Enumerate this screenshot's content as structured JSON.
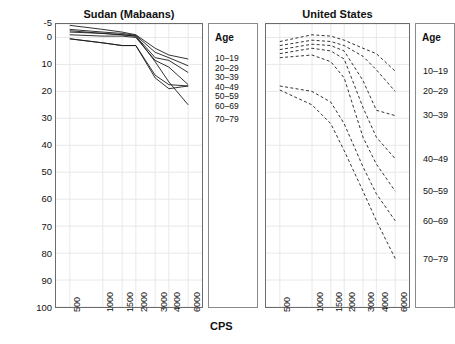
{
  "chart_data": {
    "type": "line",
    "title": "",
    "xlabel": "CPS",
    "ylabel": "Hearing loss (decibels)",
    "x": [
      500,
      1000,
      1500,
      2000,
      3000,
      4000,
      6000
    ],
    "xtick_labels": [
      "500",
      "1000",
      "1500",
      "2000",
      "3000",
      "4000",
      "6000"
    ],
    "xscale": "log",
    "ytick_labels": [
      "-5",
      "0",
      "10",
      "20",
      "30",
      "40",
      "50",
      "60",
      "70",
      "80",
      "90",
      "100"
    ],
    "ytick_values": [
      -5,
      0,
      10,
      20,
      30,
      40,
      50,
      60,
      70,
      80,
      90,
      100
    ],
    "ylim": [
      -5,
      100
    ],
    "y_inverted": true,
    "grid": true,
    "legend_title": "Age",
    "legend_entries": [
      "10–19",
      "20–29",
      "30–39",
      "40–49",
      "50–59",
      "60–69",
      "70–79"
    ],
    "panels": [
      {
        "name": "sudan",
        "title": "Sudan (Mabaans)",
        "linestyle": "solid",
        "series": [
          {
            "name": "10–19",
            "values": [
              -4.5,
              -3.0,
              -2.0,
              -1.0,
              4.0,
              6.5,
              8.0
            ]
          },
          {
            "name": "20–29",
            "values": [
              -3.0,
              -2.0,
              -1.5,
              -0.8,
              5.5,
              7.5,
              10.5
            ]
          },
          {
            "name": "30–39",
            "values": [
              -2.0,
              -1.5,
              -1.0,
              -0.5,
              7.5,
              8.5,
              13.0
            ]
          },
          {
            "name": "40–49",
            "values": [
              -1.0,
              -0.5,
              -0.5,
              0.0,
              8.5,
              11.0,
              17.5
            ]
          },
          {
            "name": "50–59",
            "values": [
              0.5,
              2.0,
              3.0,
              3.0,
              14.0,
              17.5,
              18.0
            ]
          },
          {
            "name": "60–69",
            "values": [
              0.5,
              2.0,
              3.0,
              3.0,
              15.0,
              19.0,
              18.0
            ]
          },
          {
            "name": "70–79",
            "values": [
              -2.5,
              -1.5,
              -1.0,
              -0.5,
              9.0,
              16.5,
              25.0
            ]
          }
        ]
      },
      {
        "name": "united_states",
        "title": "United States",
        "linestyle": "dashed",
        "series": [
          {
            "name": "10–19",
            "values": [
              1.5,
              -1.0,
              -0.5,
              1.0,
              4.0,
              6.0,
              12.5
            ]
          },
          {
            "name": "20–29",
            "values": [
              3.0,
              1.0,
              1.5,
              3.0,
              7.0,
              12.0,
              20.0
            ]
          },
          {
            "name": "30–39",
            "values": [
              4.5,
              2.5,
              3.0,
              5.0,
              16.0,
              27.0,
              29.0
            ]
          },
          {
            "name": "40–49",
            "values": [
              6.0,
              4.0,
              5.0,
              8.0,
              26.0,
              37.0,
              45.0
            ]
          },
          {
            "name": "50–59",
            "values": [
              7.5,
              6.5,
              9.0,
              15.0,
              37.0,
              47.0,
              57.0
            ]
          },
          {
            "name": "60–69",
            "values": [
              18.0,
              20.0,
              24.0,
              32.0,
              48.0,
              58.0,
              68.0
            ]
          },
          {
            "name": "70–79",
            "values": [
              19.5,
              25.0,
              32.0,
              42.0,
              57.0,
              68.0,
              82.0
            ]
          }
        ]
      }
    ]
  },
  "sudan_legend": {
    "title": "Age",
    "items": [
      "10–19",
      "20–29",
      "30–39",
      "40–49",
      "50–59",
      "60–69",
      "70–79"
    ]
  },
  "us_legend": {
    "title": "Age",
    "items": [
      "10–19",
      "20–29",
      "30–39",
      "40–49",
      "50–59",
      "60–69",
      "70–79"
    ]
  },
  "colors": {
    "line": "#1a1a1a",
    "grid": "#e8e8e8",
    "axis": "#6b6b6b",
    "text": "#111111"
  }
}
